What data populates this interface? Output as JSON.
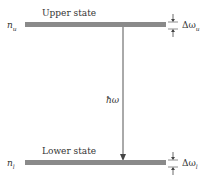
{
  "diagram": {
    "upper": {
      "label": "Upper state",
      "level": "n",
      "level_sub": "u",
      "width_label": "Δω",
      "width_sub": "u"
    },
    "lower": {
      "label": "Lower state",
      "level": "n",
      "level_sub": "l",
      "width_label": "Δω",
      "width_sub": "l"
    },
    "transition": {
      "label": "ħω"
    },
    "colors": {
      "bar": "#8a8a8a",
      "line": "#444444"
    }
  }
}
